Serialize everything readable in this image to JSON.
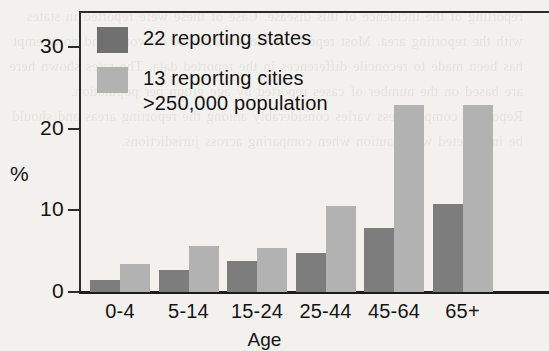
{
  "chart_data": {
    "type": "bar",
    "title": "",
    "xlabel": "Age",
    "ylabel": "%",
    "ylim": [
      0,
      33
    ],
    "yticks": [
      0,
      10,
      20,
      30
    ],
    "ytick_labels": [
      "0",
      "10",
      "20",
      "30"
    ],
    "grid": false,
    "legend_position": "inside top-left",
    "categories": [
      "0-4",
      "5-14",
      "15-24",
      "25-44",
      "45-64",
      "65+"
    ],
    "series": [
      {
        "name": "22 reporting states",
        "color": "#7d7d7d",
        "values": [
          1.5,
          2.7,
          3.8,
          4.8,
          7.8,
          10.8
        ]
      },
      {
        "name": "13 reporting cities\n>250,000 population",
        "color": "#b2b2b2",
        "values": [
          3.4,
          5.7,
          5.4,
          10.6,
          22.9,
          22.9
        ]
      }
    ]
  },
  "legend": {
    "entries": [
      {
        "label": "22 reporting states",
        "swatch": "dark"
      },
      {
        "label": "13 reporting cities\n>250,000 population",
        "swatch": "light"
      }
    ]
  },
  "axes": {
    "y_title": "%",
    "x_title": "Age",
    "y_tick_labels": [
      "30",
      "20",
      "10",
      "0"
    ],
    "x_tick_labels": [
      "0-4",
      "5-14",
      "15-24",
      "25-44",
      "45-64",
      "65+"
    ]
  },
  "background_text": "reporting of the incidence of this disease. Case of these were reported in states with the reporting area. Most reports of the surveillance networks and no attempt has been made to reconcile differences in the reported data. The rates shown here are based on the number of cases reported by age group per population. Reporting completeness varies considerably among the reporting areas and should be interpreted with caution when comparing across jurisdictions."
}
